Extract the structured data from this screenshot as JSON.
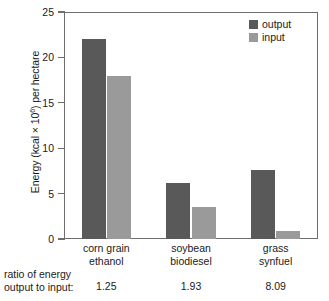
{
  "chart_data": {
    "type": "bar",
    "title": "",
    "xlabel": "",
    "ylabel": "Energy (kcal × 10⁶) per hectare",
    "ylabel_parts": {
      "prefix": "Energy (kcal × 10",
      "sup": "6",
      "suffix": ") per hectare"
    },
    "ylim": [
      0,
      25
    ],
    "yticks": [
      25,
      20,
      15,
      10,
      5,
      0
    ],
    "ytick_labels": [
      "25",
      "20",
      "15",
      "10",
      "5",
      "0"
    ],
    "grid": false,
    "legend_position": "top-right",
    "categories": [
      "corn grain ethanol",
      "soybean biodiesel",
      "grass synfuel"
    ],
    "category_lines": [
      {
        "line1": "corn grain",
        "line2": "ethanol"
      },
      {
        "line1": "soybean",
        "line2": "biodiesel"
      },
      {
        "line1": "grass",
        "line2": "synfuel"
      }
    ],
    "series": [
      {
        "name": "output",
        "color": "#595959",
        "values": [
          22.0,
          6.2,
          7.6
        ]
      },
      {
        "name": "input",
        "color": "#9a9a9a",
        "values": [
          17.9,
          3.5,
          0.9
        ]
      }
    ],
    "annotations": {
      "ratio_caption_line1": "ratio of energy",
      "ratio_caption_line2": "output to input:",
      "ratio_values": [
        "1.25",
        "1.93",
        "8.09"
      ]
    }
  },
  "colors": {
    "output": "#595959",
    "input": "#9a9a9a",
    "axis": "#6e6e6e",
    "text": "#1a1a1a",
    "background": "#ffffff"
  }
}
